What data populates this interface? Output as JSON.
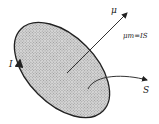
{
  "diagram": {
    "type": "magnetic-moment-of-current-loop",
    "labels": {
      "current": "I",
      "moment_vector": "μ",
      "formula": "μm=IS",
      "area": "S"
    },
    "colors": {
      "fill": "#c8c8c8",
      "stroke": "#222222",
      "background": "#ffffff"
    }
  }
}
